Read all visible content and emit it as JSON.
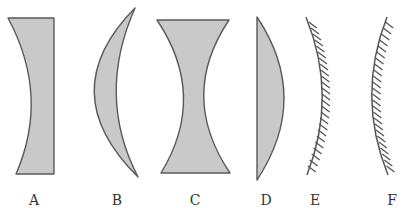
{
  "diagram": {
    "type": "optical-elements",
    "colors": {
      "lens_fill": "#c9c9c9",
      "outline": "#5a5a5a",
      "label": "#333333"
    },
    "elements": [
      {
        "id": "A",
        "label": "A",
        "kind": "plano-concave lens"
      },
      {
        "id": "B",
        "label": "B",
        "kind": "concavo-convex (meniscus) lens"
      },
      {
        "id": "C",
        "label": "C",
        "kind": "biconcave lens"
      },
      {
        "id": "D",
        "label": "D",
        "kind": "plano-convex lens"
      },
      {
        "id": "E",
        "label": "E",
        "kind": "concave mirror (reflecting on left)"
      },
      {
        "id": "F",
        "label": "F",
        "kind": "convex mirror (reflecting on left)"
      }
    ]
  }
}
